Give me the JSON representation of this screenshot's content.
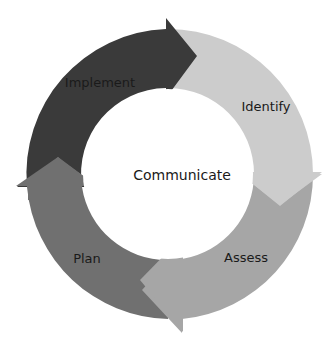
{
  "diagram": {
    "type": "cycle",
    "center_label": "Communicate",
    "stages": [
      {
        "label": "Implement",
        "color": "#3a3a3a"
      },
      {
        "label": "Identify",
        "color": "#cccccc"
      },
      {
        "label": "Assess",
        "color": "#a6a6a6"
      },
      {
        "label": "Plan",
        "color": "#707070"
      }
    ]
  }
}
